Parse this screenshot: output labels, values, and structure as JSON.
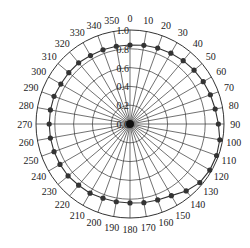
{
  "chart_data": {
    "type": "polar-line",
    "title": "",
    "angle_unit": "degrees",
    "angle_direction": "clockwise",
    "zero_location": "top",
    "angular_ticks": [
      0,
      10,
      20,
      30,
      40,
      50,
      60,
      70,
      80,
      90,
      100,
      110,
      120,
      130,
      140,
      150,
      160,
      170,
      180,
      190,
      200,
      210,
      220,
      230,
      240,
      250,
      260,
      270,
      280,
      290,
      300,
      310,
      320,
      330,
      340,
      350
    ],
    "radial_ticks": [
      0.0,
      0.2,
      0.4,
      0.6,
      0.8,
      1.0
    ],
    "rlim": [
      0,
      1.0
    ],
    "grid": true,
    "series": [
      {
        "name": "pattern",
        "marker": "circle",
        "color": "#333333",
        "angles": [
          0,
          10,
          20,
          30,
          40,
          50,
          60,
          70,
          80,
          90,
          100,
          110,
          120,
          130,
          140,
          150,
          160,
          170,
          180,
          190,
          200,
          210,
          220,
          230,
          240,
          250,
          260,
          270,
          280,
          290,
          300,
          310,
          320,
          330,
          340,
          350
        ],
        "values": [
          0.84,
          0.85,
          0.86,
          0.87,
          0.88,
          0.89,
          0.9,
          0.91,
          0.92,
          0.94,
          0.97,
          0.98,
          0.98,
          0.97,
          0.93,
          0.88,
          0.86,
          0.85,
          0.84,
          0.84,
          0.84,
          0.85,
          0.85,
          0.86,
          0.86,
          0.86,
          0.86,
          0.86,
          0.86,
          0.86,
          0.85,
          0.85,
          0.85,
          0.84,
          0.84,
          0.84
        ]
      }
    ]
  },
  "colors": {
    "grid": "#333333",
    "series": "#333333",
    "background": "#ffffff"
  }
}
